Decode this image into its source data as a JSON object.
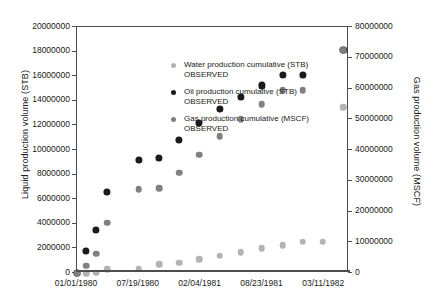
{
  "chart_data": {
    "type": "scatter",
    "title": "",
    "xlabel": "",
    "ylabel": "Liquid production volume (STB)",
    "ylabel_right": "Gas production volume (MSCF)",
    "ylim": [
      0,
      20000000
    ],
    "ylim_right": [
      0,
      80000000
    ],
    "ytick_labels": [
      "0",
      "2000000",
      "4000000",
      "6000000",
      "8000000",
      "10000000",
      "12000000",
      "14000000",
      "16000000",
      "18000000",
      "20000000"
    ],
    "ytick_values": [
      0,
      2000000,
      4000000,
      6000000,
      8000000,
      10000000,
      12000000,
      14000000,
      16000000,
      18000000,
      20000000
    ],
    "ytick_right_labels": [
      "0",
      "10000000",
      "20000000",
      "30000000",
      "40000000",
      "50000000",
      "60000000",
      "70000000",
      "80000000"
    ],
    "ytick_right_values": [
      0,
      10000000,
      20000000,
      30000000,
      40000000,
      50000000,
      60000000,
      70000000,
      80000000
    ],
    "xtick_labels": [
      "01/01/1980",
      "07/19/1980",
      "02/04/1981",
      "08/23/1981",
      "03/11/1982"
    ],
    "xtick_positions": [
      0,
      200,
      400,
      600,
      800
    ],
    "xlim": [
      0,
      880
    ],
    "grid": false,
    "legend_position": "upper-left-inside",
    "series": [
      {
        "name": "Water production cumulative (STB)",
        "sublabel": "OBSERVED",
        "color": "#b3b3b3",
        "axis": "left",
        "x": [
          0,
          30,
          62,
          97,
          200,
          265,
          330,
          395,
          462,
          530,
          598,
          665,
          730,
          795,
          862
        ],
        "values": [
          0,
          0,
          30000,
          330000,
          350000,
          730000,
          830000,
          1120000,
          1420000,
          1680000,
          2000000,
          2250000,
          2560000,
          2560000,
          13500000
        ]
      },
      {
        "name": "Oil production cumulative (STB)",
        "sublabel": "OBSERVED",
        "color": "#1a1a1a",
        "axis": "left",
        "x": [
          0,
          30,
          62,
          97,
          200,
          265,
          330,
          395,
          462,
          530,
          598,
          665,
          730,
          862
        ],
        "values": [
          0,
          1780000,
          3520000,
          6620000,
          9190000,
          9370000,
          10850000,
          12180000,
          13350000,
          14340000,
          15250000,
          16080000,
          16080000,
          18150000
        ]
      },
      {
        "name": "Gas production cumulative (MSCF)",
        "sublabel": "OBSERVED",
        "color": "#808080",
        "axis": "right",
        "x": [
          0,
          30,
          62,
          97,
          200,
          265,
          330,
          395,
          462,
          530,
          598,
          665,
          730,
          862
        ],
        "values": [
          0,
          2400000,
          6300000,
          16300000,
          27200000,
          27500000,
          32600000,
          38500000,
          44500000,
          50000000,
          54900000,
          59500000,
          59500000,
          72500000
        ]
      }
    ]
  },
  "legend": {
    "entries": [
      {
        "name": "Water production cumulative (STB)",
        "sublabel": "OBSERVED"
      },
      {
        "name": "Oil production cumulative (STB)",
        "sublabel": "OBSERVED"
      },
      {
        "name": "Gas production cumulative (MSCF)",
        "sublabel": "OBSERVED"
      }
    ]
  }
}
